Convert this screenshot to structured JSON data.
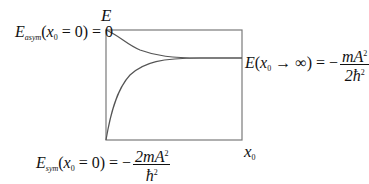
{
  "diagram": {
    "y_axis_label": "E",
    "x_axis_label": "x",
    "x_axis_label_sub": "0",
    "labels": {
      "asym": {
        "E": "E",
        "sub": "asym",
        "arg_open": "(",
        "x": "x",
        "x_sub": "0",
        "arg_rest": " = 0) = 0"
      },
      "limit": {
        "E": "E",
        "arg_open": "(",
        "x": "x",
        "x_sub": "0",
        "arrow": " → ∞) = −",
        "num": "mA",
        "num_sup": "2",
        "den": "2ħ",
        "den_sup": "2"
      },
      "sym": {
        "E": "E",
        "sub": "sym",
        "arg_open": "(",
        "x": "x",
        "x_sub": "0",
        "arg_rest": " = 0) = −",
        "num": "2mA",
        "num_sup": "2",
        "den": "ħ",
        "den_sup": "2"
      }
    },
    "curves": [
      {
        "name": "E_asym",
        "start": "0 at x0=0",
        "trend": "decreasing to asymptote"
      },
      {
        "name": "E_sym",
        "start": "-2mA^2/ħ^2 at x0=0",
        "trend": "increasing to asymptote"
      }
    ],
    "asymptote": "-mA^2/(2ħ^2)",
    "colors": {
      "axes": "#7a7a7a",
      "curves": "#555555",
      "text": "#111111"
    }
  }
}
